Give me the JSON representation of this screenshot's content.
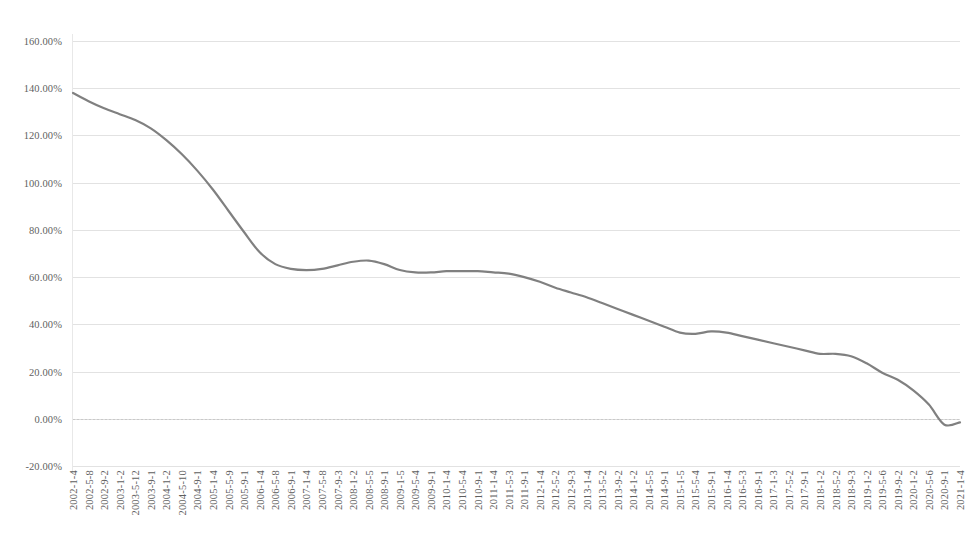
{
  "chart_data": {
    "type": "line",
    "title": "",
    "xlabel": "",
    "ylabel": "",
    "ylim": [
      -20,
      160
    ],
    "ytick_step": 20,
    "ytick_labels": [
      "160.00%",
      "140.00%",
      "120.00%",
      "100.00%",
      "80.00%",
      "60.00%",
      "40.00%",
      "20.00%",
      "0.00%",
      "-20.00%"
    ],
    "ytick_values": [
      160,
      140,
      120,
      100,
      80,
      60,
      40,
      20,
      0,
      -20
    ],
    "grid": true,
    "grid_axis": "y",
    "legend": "none",
    "series_color": "#808080",
    "series_width_px": 2.2,
    "markers": false,
    "categories": [
      "2002-1-4",
      "2002-5-8",
      "2002-9-2",
      "2003-1-2",
      "2003-5-12",
      "2003-9-1",
      "2004-1-2",
      "2004-5-10",
      "2004-9-1",
      "2005-1-4",
      "2005-5-9",
      "2005-9-1",
      "2006-1-4",
      "2006-5-8",
      "2006-9-1",
      "2007-1-4",
      "2007-5-8",
      "2007-9-3",
      "2008-1-2",
      "2008-5-5",
      "2008-9-1",
      "2009-1-5",
      "2009-5-4",
      "2009-9-1",
      "2010-1-4",
      "2010-5-4",
      "2010-9-1",
      "2011-1-4",
      "2011-5-3",
      "2011-9-1",
      "2012-1-4",
      "2012-5-2",
      "2012-9-3",
      "2013-1-4",
      "2013-5-2",
      "2013-9-2",
      "2014-1-2",
      "2014-5-5",
      "2014-9-1",
      "2015-1-5",
      "2015-5-4",
      "2015-9-1",
      "2016-1-4",
      "2016-5-3",
      "2016-9-1",
      "2017-1-3",
      "2017-5-2",
      "2017-9-1",
      "2018-1-2",
      "2018-5-2",
      "2018-9-3",
      "2019-1-2",
      "2019-5-6",
      "2019-9-2",
      "2020-1-2",
      "2020-5-6",
      "2020-9-1",
      "2021-1-4"
    ],
    "series": [
      {
        "name": "series-1",
        "values": [
          138.0,
          134.5,
          131.5,
          129.0,
          126.5,
          123.0,
          118.0,
          112.0,
          105.0,
          97.0,
          88.0,
          79.0,
          70.5,
          65.5,
          63.5,
          63.0,
          63.5,
          65.0,
          66.5,
          67.0,
          65.5,
          63.0,
          62.0,
          62.0,
          62.5,
          62.5,
          62.5,
          62.0,
          61.5,
          60.0,
          58.0,
          55.5,
          53.5,
          51.5,
          49.0,
          46.5,
          44.0,
          41.5,
          39.0,
          36.5,
          36.0,
          37.0,
          36.5,
          35.0,
          33.5,
          32.0,
          30.5,
          29.0,
          27.5,
          27.5,
          26.5,
          23.5,
          19.5,
          16.5,
          12.0,
          6.0,
          -2.5,
          -1.5
        ]
      }
    ]
  }
}
